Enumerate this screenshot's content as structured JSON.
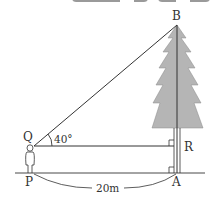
{
  "diagram": {
    "points": {
      "B": "B",
      "Q": "Q",
      "R": "R",
      "P": "P",
      "A": "A"
    },
    "angle_label": "40°",
    "distance_label": "20m",
    "colors": {
      "tree_fill": "#b5b5b5",
      "line": "#333333",
      "top_bar": "#9a9a9a"
    }
  }
}
